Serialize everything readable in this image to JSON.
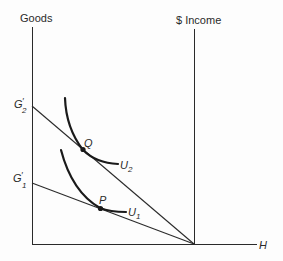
{
  "diagram": {
    "type": "economics-indifference-curve-diagram",
    "axes": {
      "vertical_left_label": "Goods",
      "vertical_right_label": "$ Income",
      "horizontal_label": "H"
    },
    "intercepts": {
      "g2_label": "G",
      "g2_prime": "′",
      "g2_sub": "2",
      "g1_label": "G",
      "g1_prime": "′",
      "g1_sub": "1"
    },
    "points": {
      "q_label": "Q",
      "p_label": "P"
    },
    "curves": {
      "u2_label": "U",
      "u2_sub": "2",
      "u1_label": "U",
      "u1_sub": "1"
    },
    "colors": {
      "line": "#2a2a2a",
      "curve": "#1a1a1a",
      "background": "#fdfdfd"
    }
  }
}
